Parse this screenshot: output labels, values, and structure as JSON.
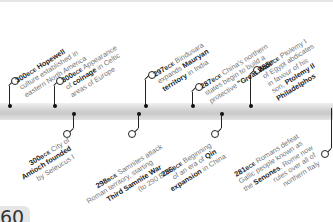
{
  "timeline": {
    "events_above": [
      {
        "year": "300",
        "era": "BCE",
        "pre": "",
        "bold": "Hopewell",
        "lines": [
          "",
          "culture established in",
          "eastern North America"
        ],
        "title_rest": ""
      },
      {
        "year": "300",
        "era": "BCE",
        "lines": [
          "Appearance",
          "of coinage in Celtic",
          "areas of Europe"
        ]
      },
      {
        "year": "297",
        "era": "BCE",
        "lines": [
          "Bindusara",
          "expands Mauryan",
          "territory in India"
        ]
      },
      {
        "year": "287",
        "era": "BCE",
        "lines": [
          "China's northern",
          "states begin to build a",
          "protective \"Great Wall\""
        ]
      },
      {
        "year": "285",
        "era": "BCE",
        "lines": [
          "Ptolemy I",
          "of Egypt abdicates",
          "in favour of his",
          "son, Ptolemy II",
          "Philadelphos"
        ]
      }
    ],
    "events_below": [
      {
        "year": "300",
        "era": "BCE",
        "lines": [
          "City of",
          "Antioch founded",
          "by Seleucus I"
        ]
      },
      {
        "year": "298",
        "era": "BCE",
        "lines": [
          "Samnites attack",
          "Roman territory, starting",
          "Third Samnite War",
          "(to 290 BCE)"
        ]
      },
      {
        "year": "286",
        "era": "BCE",
        "lines": [
          "Beginning",
          "of an era of Qin",
          "expansion in China"
        ]
      },
      {
        "year": "281",
        "era": "BCE",
        "lines": [
          "Romans defeat",
          "Gallic people known as",
          "the Senones. Rome now",
          "rules over all of",
          "northern Italy"
        ]
      }
    ],
    "text": {
      "e1_title": "Hopewell",
      "e1_l2": "culture established in",
      "e1_l3": "eastern North America",
      "e2_a": "Appearance",
      "e2_b": "of ",
      "e2_bold": "coinage",
      "e2_c": " in Celtic",
      "e2_l3": "areas of Europe",
      "e3_a": "Bindusara",
      "e3_b": "expands ",
      "e3_bold": "Mauryan",
      "e3_bold2": "territory",
      "e3_c": " in India",
      "e4_a": "China's northern",
      "e4_l2": "states begin to build a",
      "e4_b": "protective ",
      "e4_bold": "\"Great Wall\"",
      "e5_a": "Ptolemy I",
      "e5_l2": "of Egypt abdicates",
      "e5_l3": "in favour of his",
      "e5_b": "son, ",
      "e5_bold": "Ptolemy II",
      "e5_bold2": "Philadelphos",
      "b1_a": "City of",
      "b1_bold": "Antioch founded",
      "b1_l3": "by Seleucus I",
      "b2_a": "Samnites attack",
      "b2_l2": "Roman territory, starting",
      "b2_bold": "Third Samnite War",
      "b2_l4": "(to 290 BCE)",
      "b3_a": "Beginning",
      "b3_b": "of an era of ",
      "b3_bold": "Qin",
      "b3_bold2": "expansion",
      "b3_c": " in China",
      "b4_a": "Romans defeat",
      "b4_l2": "Gallic people known as",
      "b4_b": "the ",
      "b4_bold": "Senones",
      "b4_c": ". Rome now",
      "b4_l4": "rules over all of",
      "b4_l5": "northern Italy"
    },
    "years": {
      "y300": "300",
      "y297": "297",
      "y287": "287",
      "y285": "285",
      "y298": "298",
      "y286": "286",
      "y281": "281",
      "bce": "BCE"
    }
  },
  "page": {
    "number": "60"
  }
}
